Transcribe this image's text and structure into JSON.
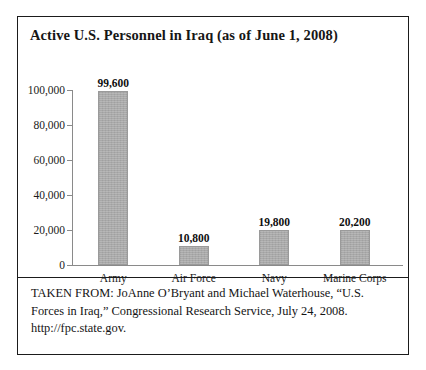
{
  "figure": {
    "title": "Active U.S. Personnel in Iraq (as of June 1, 2008)",
    "caption": "TAKEN FROM: JoAnne O’Bryant and Michael Waterhouse, “U.S. Forces in Iraq,” Congressional Research Service, July 24, 2008. http://fpc.state.gov."
  },
  "chart_data": {
    "type": "bar",
    "title": "Active U.S. Personnel in Iraq (as of June 1, 2008)",
    "xlabel": "",
    "ylabel": "",
    "categories": [
      "Army",
      "Air Force",
      "Navy",
      "Marine Corps"
    ],
    "values": [
      99600,
      10800,
      19800,
      20200
    ],
    "value_labels": [
      "99,600",
      "10,800",
      "19,800",
      "20,200"
    ],
    "ylim": [
      0,
      100000
    ],
    "ytick_values": [
      0,
      20000,
      40000,
      60000,
      80000,
      100000
    ],
    "ytick_labels": [
      "0",
      "20,000",
      "40,000",
      "60,000",
      "80,000",
      "100,000"
    ],
    "grid": false,
    "legend": null,
    "bar_color": "#a9a9a9",
    "axis_color": "#8a8a8a"
  }
}
